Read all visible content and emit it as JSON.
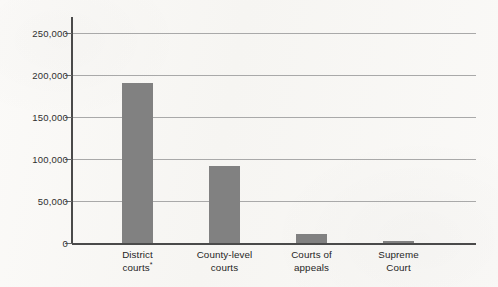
{
  "chart_data": {
    "type": "bar",
    "title": "",
    "subtitle": "",
    "xlabel": "",
    "ylabel": "",
    "categories": [
      "District courts*",
      "County-level courts",
      "Courts of appeals",
      "Supreme Court"
    ],
    "category_lines": [
      [
        "District",
        "courts",
        "*"
      ],
      [
        "County-level",
        "courts",
        ""
      ],
      [
        "Courts of",
        "appeals",
        ""
      ],
      [
        "Supreme",
        "Court",
        ""
      ]
    ],
    "values": [
      190000,
      92000,
      11000,
      2000
    ],
    "ylim": [
      0,
      250000
    ],
    "yticks": [
      0,
      50000,
      100000,
      150000,
      200000,
      250000
    ],
    "ytick_labels": [
      "0",
      "50,000",
      "100,000",
      "150,000",
      "200,000",
      "250,000"
    ],
    "grid": true,
    "legend": false,
    "legend_position": "none",
    "bar_color": "#818181",
    "axis_color": "#4a4a4a",
    "gridline_color": "#a9a9a9",
    "background_color": "#f8f7f5",
    "footnote_marker": "*"
  },
  "axis": {
    "y_tick_0": "0",
    "y_tick_1": "50,000",
    "y_tick_2": "100,000",
    "y_tick_3": "150,000",
    "y_tick_4": "200,000",
    "y_tick_5": "250,000"
  },
  "bars": {
    "b0_l1": "District",
    "b0_l2": "courts",
    "b0_fn": "*",
    "b1_l1": "County-level",
    "b1_l2": "courts",
    "b2_l1": "Courts of",
    "b2_l2": "appeals",
    "b3_l1": "Supreme",
    "b3_l2": "Court"
  }
}
